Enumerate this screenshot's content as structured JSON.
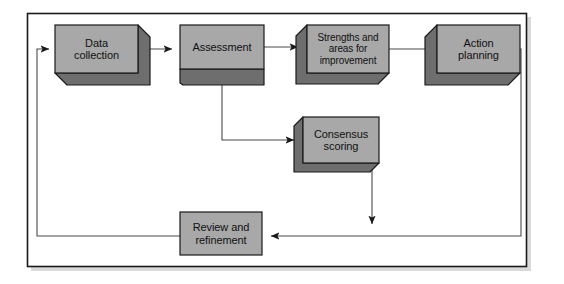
{
  "diagram": {
    "type": "process-flow-cycle",
    "title": "",
    "frame": {
      "border_color": "#1a1a1a",
      "fill_color": "#ffffff",
      "shadow_color": "#d8d8d8"
    },
    "style": {
      "box_face_color": "#a8a8a8",
      "box_shade_color": "#6e6e6e",
      "box_border_color": "#1a1a1a",
      "connector_color": "#4a4a4a",
      "text_color": "#111111"
    },
    "nodes": [
      {
        "id": "data-collection",
        "label": "Data\ncollection",
        "extrude": "right-down",
        "x": 55,
        "y": 25,
        "w": 83,
        "h": 48
      },
      {
        "id": "assessment",
        "label": "Assessment",
        "extrude": "down",
        "x": 180,
        "y": 25,
        "w": 84,
        "h": 44
      },
      {
        "id": "strengths-areas-improvement",
        "label": "Strengths and\nareas for\nimprovement",
        "extrude": "left-down",
        "x": 307,
        "y": 25,
        "w": 82,
        "h": 48
      },
      {
        "id": "action-planning",
        "label": "Action\nplanning",
        "extrude": "left-down",
        "x": 437,
        "y": 25,
        "w": 83,
        "h": 48
      },
      {
        "id": "consensus-scoring",
        "label": "Consensus\nscoring",
        "extrude": "left-down",
        "x": 303,
        "y": 117,
        "w": 76,
        "h": 46
      },
      {
        "id": "review-refinement",
        "label": "Review and\nrefinement",
        "extrude": "flat",
        "x": 180,
        "y": 212,
        "w": 82,
        "h": 43
      }
    ],
    "edges": [
      {
        "id": "edge-loop-to-data-collection",
        "from": "review-refinement",
        "to": "data-collection",
        "arrow": true
      },
      {
        "id": "edge-data-collection-to-assessment",
        "from": "data-collection",
        "to": "assessment",
        "arrow": true
      },
      {
        "id": "edge-assessment-to-strengths",
        "from": "assessment",
        "to": "strengths-areas-improvement",
        "arrow": true
      },
      {
        "id": "edge-strengths-to-action-planning",
        "from": "strengths-areas-improvement",
        "to": "action-planning",
        "arrow": false
      },
      {
        "id": "edge-assessment-to-consensus",
        "from": "assessment",
        "to": "consensus-scoring",
        "arrow": true
      },
      {
        "id": "edge-consensus-to-review-line",
        "from": "consensus-scoring",
        "to": "review-refinement",
        "arrow": true
      },
      {
        "id": "edge-action-planning-to-review",
        "from": "action-planning",
        "to": "review-refinement",
        "arrow": true
      }
    ]
  }
}
